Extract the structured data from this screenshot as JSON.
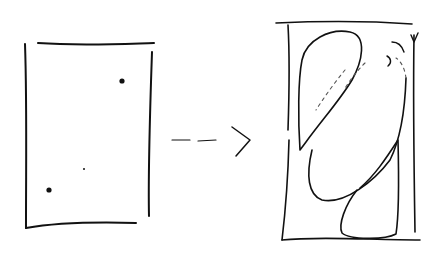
{
  "diagram": {
    "kind": "hand-drawn sketch",
    "colors": {
      "ink": "#111111",
      "background": "#ffffff"
    },
    "left_panel": {
      "shape": "rectangle",
      "contents": [
        "point-top-right",
        "point-center-small",
        "point-bottom-left"
      ]
    },
    "arrow": {
      "style": "dashed",
      "direction": "right"
    },
    "right_panel": {
      "shape": "rectangle",
      "contents": [
        "loop-top-left",
        "diagonal-ellipse",
        "loop-bottom-right",
        "small-arc-top-right"
      ]
    }
  }
}
